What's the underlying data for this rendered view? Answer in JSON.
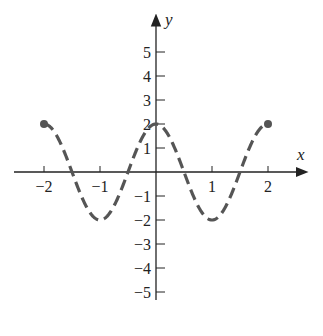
{
  "chart_data": {
    "type": "line",
    "title": "",
    "xlabel": "x",
    "ylabel": "y",
    "function_description": "y = 2cos(pi x), dashed, on [-2, 2] with closed endpoints",
    "x_ticks": [
      "-2",
      "-1",
      "1",
      "2"
    ],
    "y_ticks": [
      "5",
      "4",
      "3",
      "2",
      "1",
      "-1",
      "-2",
      "-3",
      "-4",
      "-5"
    ],
    "xlim": [
      -2.5,
      2.5
    ],
    "ylim": [
      -6,
      6.5
    ],
    "grid": false,
    "legend": null,
    "series": [
      {
        "name": "curve",
        "style": "dashed",
        "x": [
          -2,
          -1.5,
          -1,
          -0.5,
          0,
          0.5,
          1,
          1.5,
          2
        ],
        "y": [
          2,
          0,
          -2,
          0,
          2,
          0,
          -2,
          0,
          2
        ]
      }
    ],
    "endpoints": [
      {
        "x": -2,
        "y": 2,
        "closed": true
      },
      {
        "x": 2,
        "y": 2,
        "closed": true
      }
    ],
    "colors": {
      "axis": "#222222",
      "curve": "#555555"
    }
  }
}
